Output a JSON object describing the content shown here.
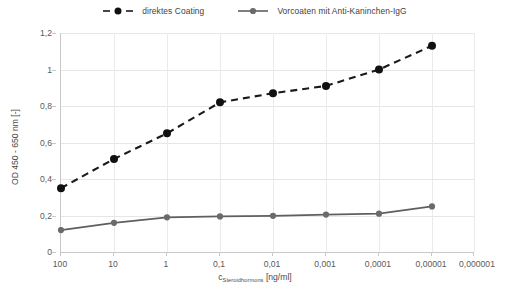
{
  "chart_data": {
    "type": "line",
    "title": "",
    "xlabel": "c_Steroidhormons [ng/ml]",
    "xlabel_main": "c",
    "xlabel_sub": "Steroidhormons",
    "xlabel_unit": " [ng/ml]",
    "ylabel": "OD 450 - 650 nm [-]",
    "categories": [
      "100",
      "10",
      "1",
      "0,1",
      "0,01",
      "0,001",
      "0,0001",
      "0,00001",
      "0,000001"
    ],
    "xticklabels": [
      "100",
      "10",
      "1",
      "0,1",
      "0,01",
      "0,001",
      "0,0001",
      "0,00001",
      "0,000001"
    ],
    "yticklabels": [
      "0",
      "0,2",
      "0,4",
      "0,6",
      "0,8",
      "1",
      "1,2"
    ],
    "ytickvalues": [
      0,
      0.2,
      0.4,
      0.6,
      0.8,
      1.0,
      1.2
    ],
    "ylim": [
      0,
      1.2
    ],
    "grid": true,
    "legend_position": "top-center",
    "series": [
      {
        "name": "direktes Coating",
        "color": "#1a1a1a",
        "style": "dashed",
        "marker": "circle",
        "x": [
          "100",
          "10",
          "1",
          "0,1",
          "0,01",
          "0,001",
          "0,0001",
          "0,00001"
        ],
        "values": [
          0.35,
          0.51,
          0.65,
          0.82,
          0.87,
          0.91,
          1.0,
          1.13
        ]
      },
      {
        "name": "Vorcoaten mit Anti-Kaninchen-IgG",
        "color": "#5f5f5f",
        "style": "solid",
        "marker": "circle",
        "x": [
          "100",
          "10",
          "1",
          "0,1",
          "0,01",
          "0,001",
          "0,0001",
          "0,00001"
        ],
        "values": [
          0.12,
          0.16,
          0.19,
          0.195,
          0.198,
          0.205,
          0.21,
          0.25
        ]
      }
    ]
  },
  "legend": {
    "entries": [
      {
        "label": "direktes Coating"
      },
      {
        "label": "Vorcoaten mit Anti-Kaninchen-IgG"
      }
    ]
  }
}
